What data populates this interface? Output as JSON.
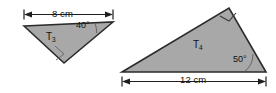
{
  "figure": {
    "background_color": "#ffffff",
    "fill_color": "#a8a8a8",
    "outline_color": "#2b2b2b",
    "width": 276,
    "height": 93
  },
  "shapes": [
    {
      "id": "T3",
      "name": "triangle-t3",
      "label": "T",
      "label_subscript": "3",
      "dimension": {
        "value": "8",
        "unit": "cm",
        "text": "8 cm",
        "position": "top",
        "side": "horizontal-top"
      },
      "angle": {
        "value": "40",
        "text": "40°",
        "vertex": "right"
      },
      "right_angle_marker": true,
      "right_angle_vertex": "bottom"
    },
    {
      "id": "T4",
      "name": "triangle-t4",
      "label": "T",
      "label_subscript": "4",
      "dimension": {
        "value": "12",
        "unit": "cm",
        "text": "12 cm",
        "position": "bottom",
        "side": "horizontal-bottom"
      },
      "angle": {
        "value": "50",
        "text": "50°",
        "vertex": "bottom-right"
      },
      "right_angle_marker": true,
      "right_angle_vertex": "top"
    }
  ],
  "labels": {
    "t3_dimension": "8 cm",
    "t3_angle": "40°",
    "t3_name": "T",
    "t3_name_sub": "3",
    "t4_dimension": "12 cm",
    "t4_angle": "50°",
    "t4_name": "T",
    "t4_name_sub": "4"
  }
}
